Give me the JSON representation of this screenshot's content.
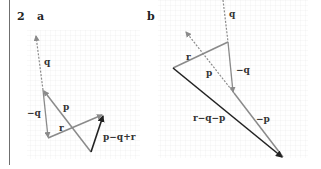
{
  "question_number": "2",
  "parts": [
    {
      "label": "a",
      "vectors": [
        {
          "name": "q",
          "style": "dashed",
          "color": "#8a8a8a"
        },
        {
          "name": "-q",
          "style": "solid",
          "color": "#8a8a8a"
        },
        {
          "name": "p",
          "style": "solid",
          "color": "#8a8a8a"
        },
        {
          "name": "r",
          "style": "solid",
          "color": "#8a8a8a"
        },
        {
          "name": "p−q+r",
          "style": "solid",
          "color": "#222222"
        }
      ],
      "labels": {
        "q": "q",
        "neg_q": "−q",
        "p": "p",
        "r": "r",
        "result": "p−q+r"
      }
    },
    {
      "label": "b",
      "vectors": [
        {
          "name": "q",
          "style": "dashed",
          "color": "#8a8a8a"
        },
        {
          "name": "-q",
          "style": "solid",
          "color": "#8a8a8a"
        },
        {
          "name": "r",
          "style": "solid",
          "color": "#8a8a8a"
        },
        {
          "name": "p",
          "style": "dashed",
          "color": "#8a8a8a"
        },
        {
          "name": "-p",
          "style": "solid",
          "color": "#8a8a8a"
        },
        {
          "name": "r−q−p",
          "style": "solid",
          "color": "#222222"
        }
      ],
      "labels": {
        "q": "q",
        "neg_q": "−q",
        "p": "p",
        "r": "r",
        "neg_p": "−p",
        "result": "r−q−p"
      }
    }
  ]
}
